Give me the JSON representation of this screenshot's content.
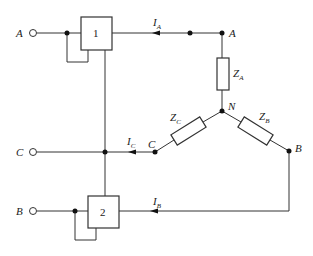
{
  "diagram": {
    "type": "circuit",
    "terminals": [
      {
        "id": "A",
        "label": "A"
      },
      {
        "id": "C",
        "label": "C"
      },
      {
        "id": "B",
        "label": "B"
      }
    ],
    "blocks": [
      {
        "id": "1",
        "label": "1"
      },
      {
        "id": "2",
        "label": "2"
      }
    ],
    "nodes": {
      "A": "A",
      "B": "B",
      "C": "C",
      "N": "N"
    },
    "impedances": [
      {
        "id": "ZA",
        "base": "Z",
        "sub": "A"
      },
      {
        "id": "ZB",
        "base": "Z",
        "sub": "B"
      },
      {
        "id": "ZC",
        "base": "Z",
        "sub": "C"
      }
    ],
    "currents": [
      {
        "id": "IA",
        "base": "I",
        "sub": "A"
      },
      {
        "id": "IB",
        "base": "I",
        "sub": "B"
      },
      {
        "id": "IC",
        "base": "I",
        "sub": "C"
      }
    ]
  }
}
